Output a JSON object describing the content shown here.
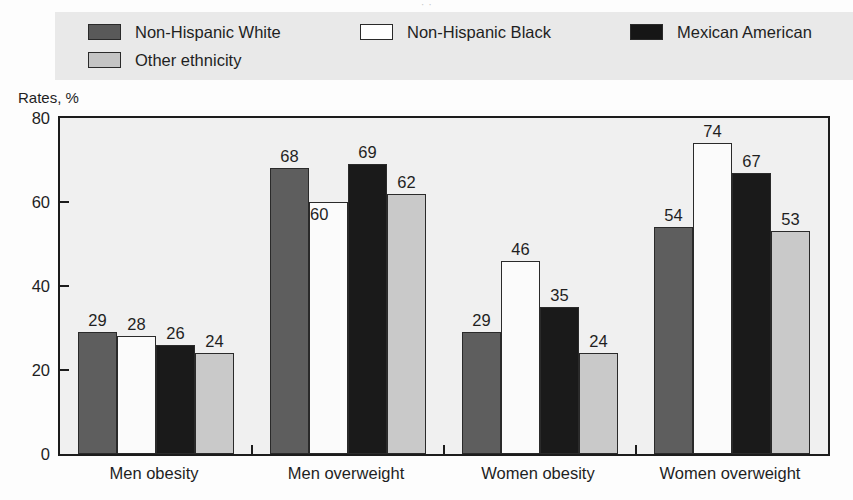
{
  "figure": {
    "title_remnant": "·   ·",
    "axis_title": "Rates, %"
  },
  "legend": {
    "entries": [
      {
        "label": "Non-Hispanic White",
        "swatch": "dark-gray-swatch",
        "color": "#5e5e5e"
      },
      {
        "label": "Non-Hispanic Black",
        "swatch": "white-swatch",
        "color": "#ffffff"
      },
      {
        "label": "Mexican American",
        "swatch": "black-swatch",
        "color": "#161616"
      },
      {
        "label": "Other ethnicity",
        "swatch": "light-gray-swatch",
        "color": "#c9c9c9"
      }
    ]
  },
  "yaxis": {
    "ticks": [
      "0",
      "20",
      "40",
      "60",
      "80"
    ]
  },
  "chart_data": {
    "type": "bar",
    "title": "",
    "xlabel": "",
    "ylabel": "Rates, %",
    "ylim": [
      0,
      80
    ],
    "yticks": [
      0,
      20,
      40,
      60,
      80
    ],
    "grid": false,
    "legend_position": "top",
    "categories": [
      "Men obesity",
      "Men overweight",
      "Women obesity",
      "Women overweight"
    ],
    "series": [
      {
        "name": "Non-Hispanic White",
        "color": "#5e5e5e",
        "values": [
          29,
          68,
          29,
          54
        ]
      },
      {
        "name": "Non-Hispanic Black",
        "color": "#ffffff",
        "values": [
          28,
          60,
          46,
          74
        ]
      },
      {
        "name": "Mexican American",
        "color": "#1a1a1a",
        "values": [
          26,
          69,
          35,
          67
        ]
      },
      {
        "name": "Other ethnicity",
        "color": "#c9c9c9",
        "values": [
          24,
          62,
          24,
          53
        ]
      }
    ]
  }
}
